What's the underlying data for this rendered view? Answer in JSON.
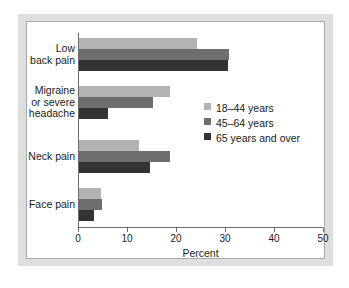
{
  "chart_data": {
    "type": "bar",
    "orientation": "horizontal",
    "title": "",
    "subtitle": "",
    "xlabel": "Percent",
    "ylabel": "",
    "xlim": [
      0,
      50
    ],
    "xticks": [
      0,
      10,
      20,
      30,
      40,
      50
    ],
    "xtick_labels": [
      "0",
      "10",
      "20",
      "30",
      "40",
      "50"
    ],
    "grid": false,
    "legend_position": "inside-right",
    "categories": [
      "Low back pain",
      "Migraine or severe headache",
      "Neck pain",
      "Face pain"
    ],
    "category_label_lines": [
      [
        "Low",
        "back pain"
      ],
      [
        "Migraine",
        "or severe",
        "headache"
      ],
      [
        "Neck pain"
      ],
      [
        "Face pain"
      ]
    ],
    "series": [
      {
        "name": "18–44 years",
        "color": "#b3b3b3",
        "values": [
          24.0,
          18.6,
          12.3,
          4.5
        ]
      },
      {
        "name": "45–64 years",
        "color": "#6e6e6e",
        "values": [
          30.7,
          15.0,
          18.6,
          4.7
        ]
      },
      {
        "name": "65 years and over",
        "color": "#333333",
        "values": [
          30.4,
          6.0,
          14.5,
          3.0
        ]
      }
    ]
  },
  "figure": {
    "frame_color": "#dedede",
    "canvas_color": "#ffffff",
    "axis_color": "#6d6d6d",
    "text_color": "#1a1a1a"
  }
}
